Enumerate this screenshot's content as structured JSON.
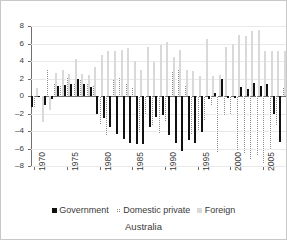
{
  "chart_data": {
    "type": "bar",
    "title": "Australia",
    "subtitle": "",
    "xlabel": "",
    "ylabel": "",
    "ylim": [
      -8,
      8
    ],
    "ytick_values": [
      8,
      6,
      4,
      2,
      0,
      -2,
      -4,
      -6,
      -8
    ],
    "ytick_labels": [
      "8",
      "6",
      "4",
      "2",
      "0",
      "–2",
      "–4",
      "–6",
      "–8"
    ],
    "grid": true,
    "legend_position": "bottom",
    "xtick_labels": [
      "1970",
      "1975",
      "1980",
      "1985",
      "1990",
      "1995",
      "2000",
      "2005"
    ],
    "xtick_years": [
      1970,
      1975,
      1980,
      1985,
      1990,
      1995,
      2000,
      2005
    ],
    "x": [
      1970,
      1971,
      1972,
      1973,
      1974,
      1975,
      1976,
      1977,
      1978,
      1979,
      1980,
      1981,
      1982,
      1983,
      1984,
      1985,
      1986,
      1987,
      1988,
      1989,
      1990,
      1991,
      1992,
      1993,
      1994,
      1995,
      1996,
      1997,
      1998,
      1999,
      2000,
      2001,
      2002,
      2003,
      2004,
      2005,
      2006,
      2007,
      2008
    ],
    "categories": [
      "1970",
      "1971",
      "1972",
      "1973",
      "1974",
      "1975",
      "1976",
      "1977",
      "1978",
      "1979",
      "1980",
      "1981",
      "1982",
      "1983",
      "1984",
      "1985",
      "1986",
      "1987",
      "1988",
      "1989",
      "1990",
      "1991",
      "1992",
      "1993",
      "1994",
      "1995",
      "1996",
      "1997",
      "1998",
      "1999",
      "2000",
      "2001",
      "2002",
      "2003",
      "2004",
      "2005",
      "2006",
      "2007",
      "2008"
    ],
    "series": [
      {
        "name": "Government",
        "color": "#111111",
        "pattern": "solid",
        "values": [
          -1.3,
          -0.1,
          -1.0,
          -0.3,
          1.1,
          1.3,
          1.4,
          1.9,
          1.4,
          1.0,
          -2.1,
          -2.5,
          -3.5,
          -4.3,
          -4.9,
          -5.4,
          -5.5,
          -5.5,
          -3.5,
          -2.4,
          -2.2,
          -4.5,
          -5.4,
          -6.3,
          -5.0,
          -5.4,
          -4.1,
          -0.3,
          0.3,
          1.9,
          -0.2,
          -0.2,
          1.0,
          0.8,
          1.5,
          1.2,
          1.4,
          -2.0,
          -5.3
        ]
      },
      {
        "name": "Domestic private",
        "color": "#8e8e8e",
        "pattern": "checkered",
        "values": [
          -1.4,
          0.0,
          3.0,
          1.5,
          1.1,
          2.1,
          1.4,
          1.9,
          1.5,
          1.1,
          -3.3,
          -4.6,
          1.8,
          2.2,
          1.5,
          1.0,
          -4.2,
          -2.2,
          -3.4,
          -4.3,
          -3.0,
          2.7,
          3.1,
          1.3,
          -4.4,
          -4.0,
          -2.9,
          -1.1,
          -6.5,
          -2.3,
          -2.2,
          -6.3,
          -6.6,
          -7.3,
          -6.9,
          -7.8,
          -6.2,
          -3.4,
          0.9
        ]
      },
      {
        "name": "Foreign",
        "color": "#d9d9d9",
        "pattern": "solid",
        "values": [
          0.9,
          -3.0,
          -1.6,
          2.6,
          3.0,
          2.5,
          4.2,
          2.5,
          2.4,
          3.3,
          4.7,
          5.2,
          5.2,
          5.3,
          5.5,
          4.0,
          3.0,
          5.6,
          3.9,
          5.8,
          6.2,
          4.5,
          5.3,
          3.0,
          2.9,
          2.3,
          6.5,
          2.3,
          2.4,
          5.6,
          6.0,
          7.0,
          6.9,
          7.4,
          7.6,
          5.2,
          5.2,
          5.2,
          5.2
        ]
      }
    ]
  },
  "legend": {
    "items": [
      {
        "label": "Government",
        "swatch": "gov"
      },
      {
        "label": "Domestic private",
        "swatch": "dom"
      },
      {
        "label": "Foreign",
        "swatch": "for"
      }
    ]
  },
  "title": "Australia"
}
